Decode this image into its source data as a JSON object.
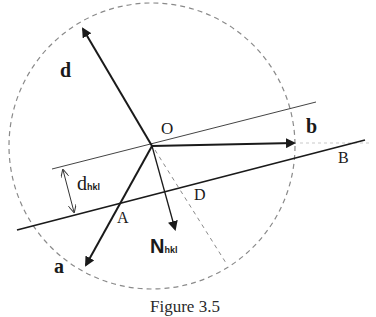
{
  "figure": {
    "caption": "Figure 3.5",
    "colors": {
      "ink": "#1a1a1a",
      "dashed": "#8a8a8a",
      "thin_line": "#444444"
    },
    "labels": {
      "origin": "O",
      "vector_a": "a",
      "vector_b": "b",
      "vector_d": "d",
      "normal_main": "N",
      "normal_sub": "hkl",
      "spacing_main": "d",
      "spacing_sub": "hkl",
      "point_A": "A",
      "point_B": "B",
      "point_D": "D"
    },
    "elements": {
      "circle": "dashed reference circle centered at O",
      "upper_plane": "thin plane line through O",
      "lower_plane": "thick plane line A–B",
      "spacing": "interplanar spacing d_hkl double arrow",
      "projection": "dashed line from O through D"
    }
  }
}
